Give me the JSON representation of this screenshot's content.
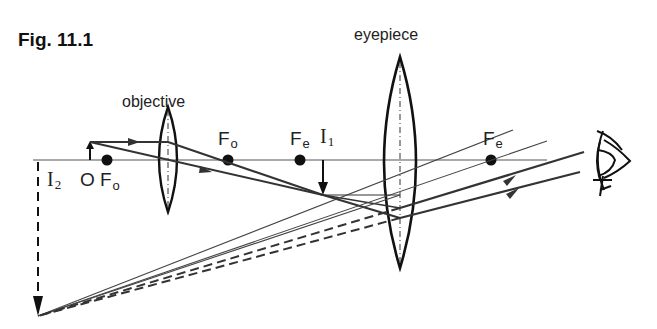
{
  "figure": {
    "title": "Fig. 11.1",
    "labels": {
      "objective": "objective",
      "eyepiece": "eyepiece",
      "object": "O",
      "focal_objective_symbol": "F",
      "focal_objective_sub": "o",
      "focal_eyepiece_symbol": "F",
      "focal_eyepiece_sub": "e",
      "image1_symbol": "I",
      "image1_sub": "1",
      "image2_symbol": "I",
      "image2_sub": "2"
    },
    "elements": {
      "principal_axis_y": 160,
      "objective_lens_x": 168,
      "eyepiece_lens_x": 400,
      "focal_points": [
        {
          "name": "Fo-left",
          "x": 107
        },
        {
          "name": "Fo-right",
          "x": 228
        },
        {
          "name": "Fe-left",
          "x": 300
        },
        {
          "name": "Fe-right",
          "x": 491
        }
      ],
      "object_arrow_x": 90,
      "intermediate_image_x": 323,
      "final_image_x": 38,
      "eye_x": 610
    },
    "colors": {
      "ink": "#1a1a1a",
      "ray": "#444444",
      "background": "#ffffff"
    }
  }
}
